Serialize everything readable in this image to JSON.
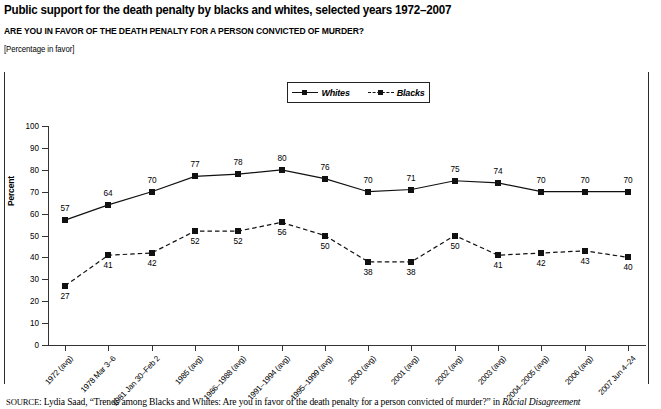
{
  "header": {
    "title": "Public support for the death penalty by blacks and whites, selected years 1972–2007",
    "subtitle": "ARE YOU IN FAVOR OF THE DEATH PENALTY FOR A PERSON CONVICTED OF MURDER?",
    "units_note": "[Percentage in favor]"
  },
  "legend": {
    "position": "top-center",
    "entries": [
      {
        "label": "Whites",
        "style": "solid",
        "marker": "square",
        "color": "#111111"
      },
      {
        "label": "Blacks",
        "style": "dashed",
        "marker": "square",
        "color": "#111111"
      }
    ]
  },
  "source": {
    "prefix": "SOURCE",
    "text": ": Lydia Saad, “Trends among Blacks and Whites: Are you in favor of the death penalty for a person convicted of murder?” in ",
    "italic_tail": "Racial Disagreement"
  },
  "chart_data": {
    "type": "line",
    "title": "Public support for the death penalty by blacks and whites, selected years 1972–2007",
    "subtitle": "ARE YOU IN FAVOR OF THE DEATH PENALTY FOR A PERSON CONVICTED OF MURDER?",
    "xlabel": "",
    "ylabel": "Percent",
    "ylim": [
      0,
      100
    ],
    "yticks": [
      0,
      10,
      20,
      30,
      40,
      50,
      60,
      70,
      80,
      90,
      100
    ],
    "grid": false,
    "legend_position": "top-center",
    "categories": [
      "1972 (avg)",
      "1978 Mar 3–6",
      "1981 Jan 30–Feb 2",
      "1985 (avg)",
      "1986–1988 (avg)",
      "1991–1994 (avg)",
      "1995–1999 (avg)",
      "2000 (avg)",
      "2001 (avg)",
      "2002 (avg)",
      "2003 (avg)",
      "2004–2005 (avg)",
      "2006 (avg)",
      "2007 Jun 4–24"
    ],
    "series": [
      {
        "name": "Whites",
        "style": "solid",
        "values": [
          57,
          64,
          70,
          77,
          78,
          80,
          76,
          70,
          71,
          75,
          74,
          70,
          70,
          70
        ],
        "label_side": [
          "above",
          "above",
          "above",
          "above",
          "above",
          "above",
          "above",
          "above",
          "above",
          "above",
          "above",
          "above",
          "above",
          "above"
        ]
      },
      {
        "name": "Blacks",
        "style": "dashed",
        "values": [
          27,
          41,
          42,
          52,
          52,
          56,
          50,
          38,
          38,
          50,
          41,
          42,
          43,
          40
        ],
        "label_side": [
          "below",
          "below",
          "below",
          "below",
          "below",
          "below",
          "below",
          "below",
          "below",
          "below",
          "below",
          "below",
          "below",
          "below"
        ]
      }
    ]
  }
}
